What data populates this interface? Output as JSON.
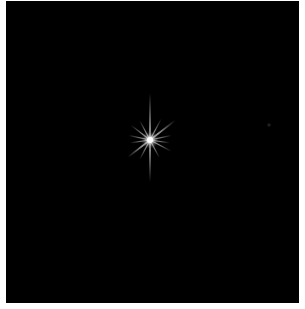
{
  "image": {
    "description": "Star with diffraction spikes on black background",
    "background_color": "#000000",
    "border_color": "#ffffff",
    "star": {
      "center": [
        150,
        140
      ],
      "core_color": "#ffffff",
      "spike_color": "#d8d8d8",
      "main_spike_length_vertical": 46,
      "main_spike_length_horizontal": 20
    },
    "faint_star": {
      "center": [
        269,
        125
      ],
      "color": "#2a2a2a"
    }
  }
}
